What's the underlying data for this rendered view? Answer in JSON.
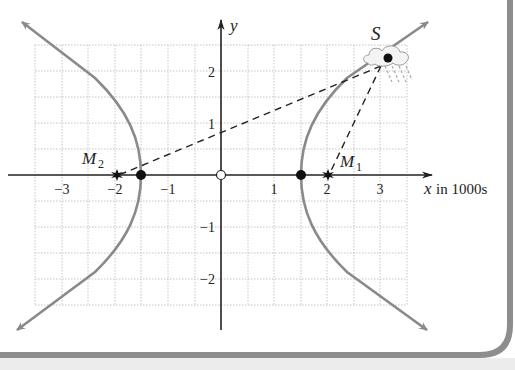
{
  "figure": {
    "x_axis_label_var": "x",
    "x_axis_label_unit": "in 1000s",
    "y_axis_label": "y",
    "x_ticks": [
      {
        "value": -3,
        "label": "−3"
      },
      {
        "value": -2,
        "label": "−2"
      },
      {
        "value": -1,
        "label": "−1"
      },
      {
        "value": 1,
        "label": "1"
      },
      {
        "value": 2,
        "label": "2"
      },
      {
        "value": 3,
        "label": "3"
      }
    ],
    "y_ticks": [
      {
        "value": 2,
        "label": "2"
      },
      {
        "value": 1,
        "label": "1"
      },
      {
        "value": -1,
        "label": "−1"
      },
      {
        "value": -2,
        "label": "−2"
      }
    ],
    "points": {
      "S": {
        "label": "S",
        "x": 3.13,
        "y": 2.25
      },
      "M1": {
        "label": "M",
        "sub": "1",
        "x": 2,
        "y": 0
      },
      "M2": {
        "label": "M",
        "sub": "2",
        "x": -2,
        "y": 0
      },
      "V1": {
        "x": 1.5,
        "y": 0
      },
      "V2": {
        "x": -1.5,
        "y": 0
      },
      "origin": {
        "x": 0,
        "y": 0
      }
    },
    "hyperbola": {
      "a": 1.5,
      "b": 1.323,
      "foci": [
        -2,
        2
      ]
    },
    "colors": {
      "curve": "#8a8a8a",
      "axis": "#222222",
      "grid": "#c8c8c8",
      "border": "#9a9a9a"
    }
  }
}
